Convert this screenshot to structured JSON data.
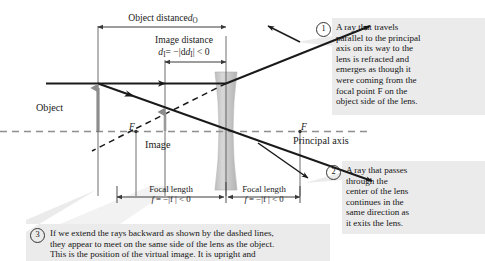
{
  "figure": {
    "background_color": "#ffffff",
    "callout_bg_color": "#ebebeb",
    "lens_color": "#c9c9c9",
    "object_arrow_color": "#8c8c8c",
    "ray_color": "#1a1a1a",
    "axis_color": "#8c8c8c"
  },
  "labels": {
    "object": "Object",
    "image": "Image",
    "principal_axis": "Principal axis",
    "focal_point_left": "F",
    "focal_point_right": "F"
  },
  "dimensions": {
    "object_distance": {
      "text": "Object distance",
      "symbol": "d",
      "subscript": "O"
    },
    "image_distance": {
      "line1": "Image distance",
      "symbol": "d",
      "subscript": "I",
      "equation": "= −|d",
      "equation_tail": "| < 0"
    },
    "focal_length_left": {
      "line1": "Focal length",
      "symbol": "f",
      "equation": "= −|f | < 0"
    },
    "focal_length_right": {
      "line1": "Focal length",
      "symbol": "f",
      "equation": "= −|f | < 0"
    }
  },
  "callouts": [
    {
      "number": "1",
      "text": "A ray that travels\nparallel to the principal\naxis on its way to the\nlens is refracted and\nemerges as though it\nwere coming from the\nfocal point F on the\nobject side of the lens."
    },
    {
      "number": "2",
      "text": "A ray that passes\nthrough the\ncenter of the lens\ncontinues in the\nsame direction as\nit exits the lens."
    },
    {
      "number": "3",
      "text": "If we extend the rays backward as shown by the dashed lines,\nthey appear to meet on the same side of the lens as the object.\nThis is the position of the virtual image. It is upright and"
    }
  ]
}
